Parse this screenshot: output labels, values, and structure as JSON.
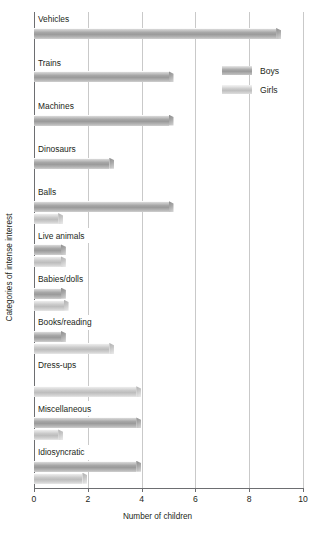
{
  "chart_data": {
    "type": "bar",
    "orientation": "horizontal",
    "title": "",
    "xlabel": "Number of children",
    "ylabel": "Categories of intense interest",
    "xlim": [
      0,
      10
    ],
    "xticks": [
      0,
      2,
      4,
      6,
      8,
      10
    ],
    "grid": true,
    "legend_position": "upper-right-inside",
    "categories": [
      "Vehicles",
      "Trains",
      "Machines",
      "Dinosaurs",
      "Balls",
      "Live animals",
      "Babies/dolls",
      "Books/reading",
      "Dress-ups",
      "Miscellaneous",
      "Idiosyncratic"
    ],
    "series": [
      {
        "name": "Boys",
        "color": "#a0a0a0",
        "values": [
          9.0,
          5.0,
          5.0,
          2.8,
          5.0,
          1.0,
          1.0,
          1.0,
          0,
          3.8,
          3.8
        ]
      },
      {
        "name": "Girls",
        "color": "#c6c6c6",
        "values": [
          0,
          0,
          0,
          0,
          0.9,
          1.0,
          1.1,
          2.8,
          3.8,
          0.9,
          1.8
        ]
      }
    ]
  },
  "legend": {
    "entries": [
      {
        "label": "Boys",
        "swatch": "boys"
      },
      {
        "label": "Girls",
        "swatch": "girls"
      }
    ]
  },
  "axis": {
    "x_tick_labels": [
      "0",
      "2",
      "4",
      "6",
      "8",
      "10"
    ]
  }
}
